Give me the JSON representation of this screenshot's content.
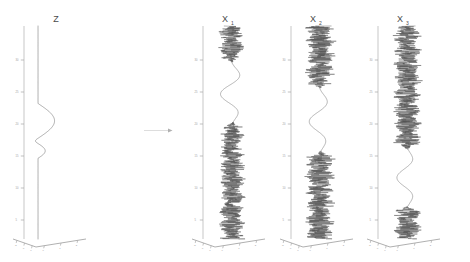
{
  "figure": {
    "background": "#ffffff",
    "curve_color": "#4f4f4f",
    "axis_color": "#b9b9b9",
    "title_color": "#4a4a4a",
    "arrow": {
      "name": "maps-to-arrow",
      "from_panel": "Z",
      "to_panel": "X1"
    }
  },
  "panels": [
    {
      "id": "z",
      "title": "Z",
      "subscript": "",
      "title_x": 56,
      "axis_x": 24,
      "axis_top": 26,
      "axis_bottom": 239,
      "base_vertex_x": 36,
      "base_left_x": 13,
      "base_right_x": 86,
      "base_y": 239,
      "base_dip_y": 247,
      "series_center_x": 38,
      "yticks": [
        "30",
        "25",
        "20",
        "15",
        "10",
        "5"
      ],
      "ytick_y": [
        60,
        92,
        124,
        156,
        188,
        220
      ],
      "xticks_left": [
        "-2",
        "-1",
        "0"
      ],
      "xticks_right": [
        "0",
        "1",
        "2"
      ],
      "description": "latent smooth signal: flat baseline with one large bulge and one small bulge"
    },
    {
      "id": "x1",
      "title": "X",
      "subscript": "1",
      "title_x": 225,
      "axis_x": 203,
      "axis_top": 26,
      "axis_bottom": 239,
      "base_vertex_x": 215,
      "base_left_x": 192,
      "base_right_x": 265,
      "base_y": 239,
      "base_dip_y": 247,
      "series_center_x": 232,
      "yticks": [
        "30",
        "25",
        "20",
        "15",
        "10",
        "5"
      ],
      "ytick_y": [
        60,
        92,
        124,
        156,
        188,
        220
      ],
      "xticks_left": [
        "-2",
        "-1",
        "0"
      ],
      "xticks_right": [
        "0",
        "1",
        "2"
      ],
      "description": "observed channel 1: noise top, smooth oscillation upper-middle, dense noise lower half"
    },
    {
      "id": "x2",
      "title": "X",
      "subscript": "2",
      "title_x": 313,
      "axis_x": 291,
      "axis_top": 26,
      "axis_bottom": 239,
      "base_vertex_x": 303,
      "base_left_x": 280,
      "base_right_x": 353,
      "base_y": 239,
      "base_dip_y": 247,
      "series_center_x": 320,
      "yticks": [
        "30",
        "25",
        "20",
        "15",
        "10",
        "5"
      ],
      "ytick_y": [
        60,
        92,
        124,
        156,
        188,
        220
      ],
      "xticks_left": [
        "-2",
        "-1",
        "0"
      ],
      "xticks_right": [
        "0",
        "1",
        "2"
      ],
      "description": "observed channel 2: dense noise top, smooth oscillation middle, dense noise bottom"
    },
    {
      "id": "x3",
      "title": "X",
      "subscript": "3",
      "title_x": 400,
      "axis_x": 378,
      "axis_top": 26,
      "axis_bottom": 239,
      "base_vertex_x": 390,
      "base_left_x": 367,
      "base_right_x": 440,
      "base_y": 239,
      "base_dip_y": 247,
      "series_center_x": 407,
      "yticks": [
        "30",
        "25",
        "20",
        "15",
        "10",
        "5"
      ],
      "ytick_y": [
        60,
        92,
        124,
        156,
        188,
        220
      ],
      "xticks_left": [
        "-2",
        "-1",
        "0"
      ],
      "xticks_right": [
        "0",
        "1",
        "2"
      ],
      "description": "observed channel 3: dense noise upper two-thirds, smooth oscillation lower-middle, noise at bottom"
    }
  ],
  "chart_data": {
    "type": "line",
    "title": "",
    "xlabel": "",
    "ylabel": "",
    "orientation": "vertical-time-axis",
    "n_panels": 4,
    "panel_titles": [
      "Z",
      "X1",
      "X2",
      "X3"
    ],
    "y_axis": {
      "tick_labels": [
        "5",
        "10",
        "15",
        "20",
        "25",
        "30"
      ],
      "range": [
        0,
        33
      ],
      "grid": false
    },
    "x_axis": {
      "tick_labels": [
        "-2",
        "-1",
        "0",
        "1",
        "2"
      ],
      "range": [
        -2.5,
        2.5
      ],
      "grid": false
    },
    "legend": {
      "entries": [],
      "position": "none"
    },
    "series": [
      {
        "name": "Z",
        "panel": "z",
        "kind": "smooth-latent",
        "segments": [
          {
            "type": "flat",
            "t_from": 0,
            "t_to": 12.5,
            "value": 0.0
          },
          {
            "type": "bulge",
            "t_from": 12.5,
            "t_to": 14.8,
            "peak": 1.0,
            "note": "small secondary bulge"
          },
          {
            "type": "trough",
            "t_from": 14.8,
            "t_to": 15.6,
            "peak": -0.35
          },
          {
            "type": "bulge",
            "t_from": 15.6,
            "t_to": 21.0,
            "peak": 2.3,
            "note": "large primary bulge"
          },
          {
            "type": "flat",
            "t_from": 21.0,
            "t_to": 33,
            "value": 0.0
          }
        ]
      },
      {
        "name": "X1",
        "panel": "x1",
        "kind": "noise-plus-signal",
        "smooth_window": [
          17.5,
          28.0
        ],
        "smooth_amplitude": 1.6,
        "smooth_cycles": 1.6,
        "noise_windows": [
          [
            0,
            17.5
          ],
          [
            29.5,
            33
          ]
        ],
        "noise_amplitude": 2.1
      },
      {
        "name": "X2",
        "panel": "x2",
        "kind": "noise-plus-signal",
        "smooth_window": [
          13.0,
          24.0
        ],
        "smooth_amplitude": 1.5,
        "smooth_cycles": 1.6,
        "noise_windows": [
          [
            0,
            13.0
          ],
          [
            24.0,
            33
          ]
        ],
        "noise_amplitude": 2.4
      },
      {
        "name": "X3",
        "panel": "x3",
        "kind": "noise-plus-signal",
        "smooth_window": [
          4.5,
          14.5
        ],
        "smooth_amplitude": 1.4,
        "smooth_cycles": 1.5,
        "noise_windows": [
          [
            0,
            4.5
          ],
          [
            14.5,
            33
          ]
        ],
        "noise_amplitude": 2.3
      }
    ]
  }
}
